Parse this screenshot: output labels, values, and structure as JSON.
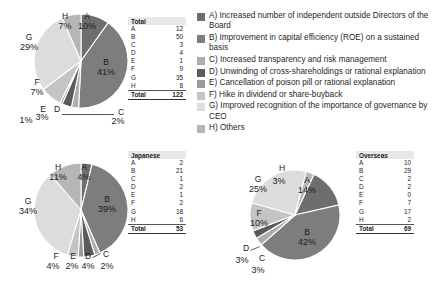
{
  "chart_data": [
    {
      "type": "pie",
      "title": "Total",
      "categories": [
        "A",
        "B",
        "C",
        "D",
        "E",
        "F",
        "G",
        "H"
      ],
      "values": [
        12,
        50,
        3,
        4,
        1,
        9,
        35,
        8
      ],
      "percent_labels": [
        "10%",
        "41%",
        "2%",
        "3%",
        "1%",
        "7%",
        "29%",
        "7%"
      ],
      "total_label": "Total",
      "total_value": "122"
    },
    {
      "type": "pie",
      "title": "Japanese",
      "categories": [
        "A",
        "B",
        "C",
        "D",
        "E",
        "F",
        "G",
        "H"
      ],
      "values": [
        2,
        21,
        1,
        2,
        1,
        2,
        18,
        6
      ],
      "percent_labels": [
        "4%",
        "39%",
        "2%",
        "4%",
        "2%",
        "4%",
        "34%",
        "11%"
      ],
      "total_label": "Total",
      "total_value": "53"
    },
    {
      "type": "pie",
      "title": "Overseas",
      "categories": [
        "A",
        "B",
        "C",
        "D",
        "E",
        "F",
        "G",
        "H"
      ],
      "values": [
        10,
        29,
        2,
        2,
        0,
        7,
        17,
        2
      ],
      "percent_labels": [
        "14%",
        "42%",
        "3%",
        "3%",
        "0%",
        "10%",
        "25%",
        "3%"
      ],
      "total_label": "Total",
      "total_value": "69"
    }
  ],
  "legend": {
    "items": [
      {
        "key": "A",
        "label": "A) Increased number of independent outside Directors of the Board",
        "color": "#6e6e6e"
      },
      {
        "key": "B",
        "label": "B) Improvement in capital efficiency (ROE) on a sustained basis",
        "color": "#7d7d7d"
      },
      {
        "key": "C",
        "label": "C) Increased transparency and risk management",
        "color": "#aeaeae"
      },
      {
        "key": "D",
        "label": "D) Unwinding of cross-shareholdings or rational explanation",
        "color": "#5b5b5b"
      },
      {
        "key": "E",
        "label": "E) Cancellation of poison pill or rational explanation",
        "color": "#9a9a9a"
      },
      {
        "key": "F",
        "label": "F) Hike in dividend or share-buyback",
        "color": "#c4c4c4"
      },
      {
        "key": "G",
        "label": "G) Improved recognition of the importance of governance by CEO",
        "color": "#dcdcdc"
      },
      {
        "key": "H",
        "label": "H) Others",
        "color": "#b6b6b6"
      }
    ]
  },
  "tables": {
    "total": {
      "header": "Total",
      "rows": [
        {
          "k": "A",
          "v": "12"
        },
        {
          "k": "B",
          "v": "50"
        },
        {
          "k": "C",
          "v": "3"
        },
        {
          "k": "D",
          "v": "4"
        },
        {
          "k": "E",
          "v": "1"
        },
        {
          "k": "F",
          "v": "9"
        },
        {
          "k": "G",
          "v": "35"
        },
        {
          "k": "H",
          "v": "8"
        }
      ],
      "total_key": "Total",
      "total_value": "122"
    },
    "japanese": {
      "header": "Japanese",
      "rows": [
        {
          "k": "A",
          "v": "2"
        },
        {
          "k": "B",
          "v": "21"
        },
        {
          "k": "C",
          "v": "1"
        },
        {
          "k": "D",
          "v": "2"
        },
        {
          "k": "E",
          "v": "1"
        },
        {
          "k": "F",
          "v": "2"
        },
        {
          "k": "G",
          "v": "18"
        },
        {
          "k": "H",
          "v": "6"
        }
      ],
      "total_key": "Total",
      "total_value": "53"
    },
    "overseas": {
      "header": "Overseas",
      "rows": [
        {
          "k": "A",
          "v": "10"
        },
        {
          "k": "B",
          "v": "29"
        },
        {
          "k": "C",
          "v": "2"
        },
        {
          "k": "D",
          "v": "2"
        },
        {
          "k": "E",
          "v": "0"
        },
        {
          "k": "F",
          "v": "7"
        },
        {
          "k": "G",
          "v": "17"
        },
        {
          "k": "H",
          "v": "2"
        }
      ],
      "total_key": "Total",
      "total_value": "69"
    }
  },
  "pie_labels": {
    "total": {
      "A": {
        "letter": "A",
        "pct": "10%"
      },
      "B": {
        "letter": "B",
        "pct": "41%"
      },
      "C": {
        "letter": "C",
        "pct": "2%"
      },
      "D": {
        "letter": "D",
        "pct": "3%"
      },
      "E": {
        "letter": "E",
        "pct": "1%"
      },
      "F": {
        "letter": "F",
        "pct": "7%"
      },
      "G": {
        "letter": "G",
        "pct": "29%"
      },
      "H": {
        "letter": "H",
        "pct": "7%"
      }
    },
    "japanese": {
      "A": {
        "letter": "A",
        "pct": "4%"
      },
      "B": {
        "letter": "B",
        "pct": "39%"
      },
      "C": {
        "letter": "C",
        "pct": "2%"
      },
      "D": {
        "letter": "D",
        "pct": "4%"
      },
      "E": {
        "letter": "E",
        "pct": "2%"
      },
      "F": {
        "letter": "F",
        "pct": "4%"
      },
      "G": {
        "letter": "G",
        "pct": "34%"
      },
      "H": {
        "letter": "H",
        "pct": "11%"
      }
    },
    "overseas": {
      "A": {
        "letter": "A",
        "pct": "14%"
      },
      "B": {
        "letter": "B",
        "pct": "42%"
      },
      "C": {
        "letter": "C",
        "pct": "3%"
      },
      "D": {
        "letter": "D",
        "pct": "3%"
      },
      "F": {
        "letter": "F",
        "pct": "10%"
      },
      "G": {
        "letter": "G",
        "pct": "25%"
      },
      "H": {
        "letter": "H",
        "pct": "3%"
      }
    }
  }
}
